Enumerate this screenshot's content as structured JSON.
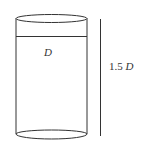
{
  "diagram": {
    "shape": "cylinder",
    "labels": {
      "diameter": "D",
      "height_value": "1.5",
      "height_var": "D"
    },
    "colors": {
      "stroke": "#333333",
      "background": "#ffffff"
    }
  }
}
